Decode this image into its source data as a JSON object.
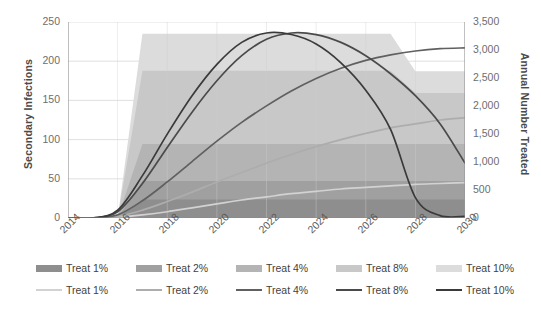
{
  "chart_data": {
    "type": "area",
    "title": "",
    "xlabel": "",
    "ylabel": "Secondary Infections",
    "y2label": "Annual Number Treated",
    "x": [
      2014,
      2015,
      2016,
      2017,
      2018,
      2019,
      2020,
      2021,
      2022,
      2023,
      2024,
      2025,
      2026,
      2027,
      2028,
      2029,
      2030
    ],
    "xticks": [
      "2014",
      "2016",
      "2018",
      "2020",
      "2022",
      "2024",
      "2026",
      "2028",
      "2030"
    ],
    "xlim": [
      2014,
      2030
    ],
    "ylim": [
      0,
      250
    ],
    "yticks": [
      "0",
      "50",
      "100",
      "150",
      "200",
      "250"
    ],
    "y2lim": [
      0,
      3500
    ],
    "y2ticks": [
      "0",
      "500",
      "1,000",
      "1,500",
      "2,000",
      "2,500",
      "3,000",
      "3,500"
    ],
    "grid": true,
    "legend_position": "bottom",
    "areas": [
      {
        "name": "Treat 1%",
        "axis": "right",
        "color": "#8e8e8e",
        "values": [
          0,
          0,
          0,
          330,
          330,
          330,
          330,
          330,
          330,
          330,
          330,
          330,
          330,
          330,
          330,
          330,
          330
        ]
      },
      {
        "name": "Treat 2%",
        "axis": "right",
        "color": "#a0a0a0",
        "values": [
          0,
          0,
          0,
          660,
          660,
          660,
          660,
          660,
          660,
          660,
          660,
          660,
          660,
          660,
          660,
          660,
          660
        ]
      },
      {
        "name": "Treat 4%",
        "axis": "right",
        "color": "#b4b4b4",
        "values": [
          0,
          0,
          0,
          1320,
          1320,
          1320,
          1320,
          1320,
          1320,
          1320,
          1320,
          1320,
          1320,
          1320,
          1320,
          1320,
          1320
        ]
      },
      {
        "name": "Treat 8%",
        "axis": "right",
        "color": "#c8c8c8",
        "values": [
          0,
          0,
          0,
          2630,
          2630,
          2630,
          2630,
          2630,
          2630,
          2630,
          2630,
          2630,
          2630,
          2630,
          2230,
          2230,
          2230
        ]
      },
      {
        "name": "Treat 10%",
        "axis": "right",
        "color": "#dcdcdc",
        "values": [
          0,
          0,
          0,
          3290,
          3290,
          3290,
          3290,
          3290,
          3290,
          3290,
          3290,
          3290,
          3290,
          3290,
          2620,
          2620,
          2620
        ]
      }
    ],
    "lines": [
      {
        "name": "Treat 1%",
        "axis": "left",
        "color": "#d2d2d2",
        "values": [
          0,
          0,
          1,
          4,
          8,
          13,
          18,
          23,
          27,
          31,
          34,
          37,
          39,
          41,
          43,
          44,
          45
        ]
      },
      {
        "name": "Treat 2%",
        "axis": "left",
        "color": "#adadad",
        "values": [
          0,
          0,
          2,
          10,
          21,
          33,
          46,
          58,
          70,
          81,
          91,
          100,
          108,
          115,
          120,
          125,
          128
        ]
      },
      {
        "name": "Treat 4%",
        "axis": "left",
        "color": "#606060",
        "values": [
          0,
          0,
          4,
          22,
          46,
          72,
          98,
          122,
          143,
          162,
          178,
          191,
          201,
          208,
          213,
          216,
          217
        ]
      },
      {
        "name": "Treat 8%",
        "axis": "left",
        "color": "#4a4a4a",
        "values": [
          0,
          0,
          8,
          44,
          90,
          135,
          175,
          207,
          228,
          236,
          234,
          224,
          207,
          184,
          156,
          120,
          70
        ]
      },
      {
        "name": "Treat 10%",
        "axis": "left",
        "color": "#3a3a3a",
        "values": [
          0,
          0,
          10,
          54,
          107,
          156,
          196,
          224,
          236,
          234,
          222,
          198,
          163,
          113,
          26,
          3,
          2
        ]
      }
    ]
  },
  "axes": {
    "left_title": "Secondary Infections",
    "right_title": "Annual Number Treated"
  },
  "legend": {
    "area_row": [
      {
        "label": "Treat 1%",
        "color": "#8e8e8e"
      },
      {
        "label": "Treat 2%",
        "color": "#a0a0a0"
      },
      {
        "label": "Treat 4%",
        "color": "#b4b4b4"
      },
      {
        "label": "Treat 8%",
        "color": "#c8c8c8"
      },
      {
        "label": "Treat 10%",
        "color": "#dcdcdc"
      }
    ],
    "line_row": [
      {
        "label": "Treat 1%",
        "color": "#d2d2d2"
      },
      {
        "label": "Treat 2%",
        "color": "#adadad"
      },
      {
        "label": "Treat 4%",
        "color": "#606060"
      },
      {
        "label": "Treat 8%",
        "color": "#4a4a4a"
      },
      {
        "label": "Treat 10%",
        "color": "#3a3a3a"
      }
    ]
  }
}
